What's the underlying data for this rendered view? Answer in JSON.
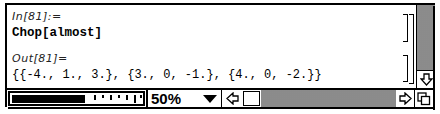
{
  "notebook": {
    "input_label": "In[81]:=",
    "input_code": "Chop[almost]",
    "output_label": "Out[81]=",
    "output_code": "{{-4., 1., 3.}, {3., 0, -1.}, {4., 0, -2.}}"
  },
  "bottom_bar": {
    "magnification": "50%",
    "magnification_menu_icon": "triangle-down",
    "scroll_left_icon": "arrow-left",
    "scroll_right_icon": "arrow-right",
    "grow_box_icon": "resize"
  },
  "vertical_scrollbar": {
    "scroll_down_icon": "arrow-down"
  }
}
